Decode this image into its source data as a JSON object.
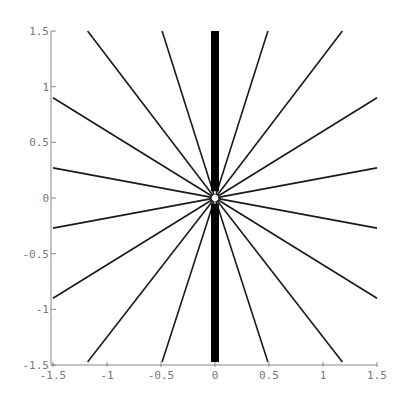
{
  "chart_data": {
    "type": "line",
    "title": "",
    "xlabel": "",
    "ylabel": "",
    "xlim": [
      -1.5,
      1.5
    ],
    "ylim": [
      -1.5,
      1.5
    ],
    "grid": false,
    "x_ticks": [
      -1.5,
      -1,
      -0.5,
      0,
      0.5,
      1,
      1.5
    ],
    "x_tick_labels": [
      "-1.5",
      "-1",
      "-0.5",
      "0",
      "0.5",
      "1",
      "1.5"
    ],
    "y_ticks": [
      -1.5,
      -1,
      -0.5,
      0,
      0.5,
      1,
      1.5
    ],
    "y_tick_labels": [
      "-1.5",
      "-1",
      "-0.5",
      "0",
      "0.5",
      "1",
      "1.5"
    ],
    "series": [
      {
        "name": "ray-10deg",
        "points": [
          [
            0,
            0
          ],
          [
            1.5,
            0.27
          ]
        ]
      },
      {
        "name": "ray-31deg",
        "points": [
          [
            0,
            0
          ],
          [
            1.5,
            0.9
          ]
        ]
      },
      {
        "name": "ray-52deg",
        "points": [
          [
            0,
            0
          ],
          [
            1.18,
            1.5
          ]
        ]
      },
      {
        "name": "ray-72deg",
        "points": [
          [
            0,
            0
          ],
          [
            0.49,
            1.5
          ]
        ]
      },
      {
        "name": "ray-108deg",
        "points": [
          [
            0,
            0
          ],
          [
            -0.49,
            1.5
          ]
        ]
      },
      {
        "name": "ray-128deg",
        "points": [
          [
            0,
            0
          ],
          [
            -1.18,
            1.5
          ]
        ]
      },
      {
        "name": "ray-149deg",
        "points": [
          [
            0,
            0
          ],
          [
            -1.5,
            0.9
          ]
        ]
      },
      {
        "name": "ray-170deg",
        "points": [
          [
            0,
            0
          ],
          [
            -1.5,
            0.27
          ]
        ]
      },
      {
        "name": "ray-190deg",
        "points": [
          [
            0,
            0
          ],
          [
            -1.5,
            -0.27
          ]
        ]
      },
      {
        "name": "ray-211deg",
        "points": [
          [
            0,
            0
          ],
          [
            -1.5,
            -0.9
          ]
        ]
      },
      {
        "name": "ray-232deg",
        "points": [
          [
            0,
            0
          ],
          [
            -1.18,
            -1.5
          ]
        ]
      },
      {
        "name": "ray-252deg",
        "points": [
          [
            0,
            0
          ],
          [
            -0.49,
            -1.5
          ]
        ]
      },
      {
        "name": "ray-288deg",
        "points": [
          [
            0,
            0
          ],
          [
            0.49,
            -1.5
          ]
        ]
      },
      {
        "name": "ray-308deg",
        "points": [
          [
            0,
            0
          ],
          [
            1.18,
            -1.5
          ]
        ]
      },
      {
        "name": "ray-329deg",
        "points": [
          [
            0,
            0
          ],
          [
            1.5,
            -0.9
          ]
        ]
      },
      {
        "name": "ray-350deg",
        "points": [
          [
            0,
            0
          ],
          [
            1.5,
            -0.27
          ]
        ]
      }
    ],
    "vertical_bar": {
      "x": 0,
      "y_range": [
        -1.5,
        1.5
      ],
      "gap_near_origin": [
        -0.05,
        0.06
      ]
    }
  }
}
